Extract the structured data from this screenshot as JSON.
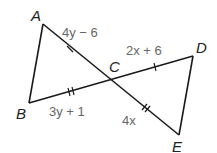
{
  "diagram": {
    "points": {
      "A": {
        "label": "A",
        "x": 43,
        "y": 24
      },
      "B": {
        "label": "B",
        "x": 29,
        "y": 103
      },
      "C": {
        "label": "C",
        "x": 112,
        "y": 79
      },
      "D": {
        "label": "D",
        "x": 193,
        "y": 56
      },
      "E": {
        "label": "E",
        "x": 179,
        "y": 135
      }
    },
    "segments": [
      {
        "from": "A",
        "to": "B"
      },
      {
        "from": "A",
        "to": "E",
        "passes_through": "C"
      },
      {
        "from": "B",
        "to": "D",
        "passes_through": "C"
      },
      {
        "from": "D",
        "to": "E"
      }
    ],
    "segment_labels": {
      "AC": "4y − 6",
      "CD": "2x + 6",
      "BC": "3y + 1",
      "CE": "4x"
    },
    "tick_marks": {
      "AC": 1,
      "CD": 1,
      "BC": 2,
      "CE": 2
    },
    "colors": {
      "line": "#1a1a1a",
      "point_label": "#222222",
      "expression_label": "#666666"
    }
  }
}
